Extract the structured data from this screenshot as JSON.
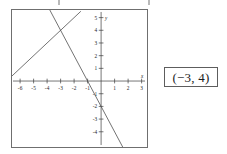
{
  "answer": {
    "name": "solution-coordinate",
    "text": "(−3, 4)"
  },
  "chart_data": {
    "type": "line",
    "title": "",
    "xlabel": "x",
    "ylabel": "y",
    "xlim": [
      -6.6,
      3.4
    ],
    "ylim": [
      -5.2,
      5.6
    ],
    "grid": false,
    "legend": "none",
    "x_ticks": [
      -6,
      -5,
      -4,
      -3,
      -2,
      -1,
      1,
      2,
      3
    ],
    "x_tick_labels": [
      "-6",
      "-5",
      "-4",
      "-3",
      "-2",
      "-1",
      "1",
      "2",
      "3"
    ],
    "y_ticks": [
      -4,
      -3,
      -2,
      -1,
      1,
      2,
      3,
      4,
      5
    ],
    "y_tick_labels": [
      "-4",
      "-3",
      "-2",
      "-1",
      "1",
      "2",
      "3",
      "4",
      "5"
    ],
    "axis_arrow_labels": {
      "x": "x",
      "y": "y"
    },
    "intersection": {
      "x": -3,
      "y": 4,
      "label": "(−3, 4)"
    },
    "series": [
      {
        "name": "line-1",
        "slope": 1,
        "intercept": 7,
        "color": "#4d4d4d",
        "points": [
          [
            -6.6,
            0.4
          ],
          [
            -1.5,
            5.5
          ]
        ]
      },
      {
        "name": "line-2",
        "slope": -2,
        "intercept": -2,
        "color": "#4d4d4d",
        "points": [
          [
            -3.8,
            5.6
          ],
          [
            3.3,
            -8.6
          ]
        ]
      }
    ]
  },
  "colors": {
    "axis": "#3a3a3a",
    "line": "#4d4d4d",
    "panel_border": "#6f6f6f",
    "answer_border": "#5d5d5d",
    "text": "#1c1c1c",
    "background": "#ffffff"
  }
}
